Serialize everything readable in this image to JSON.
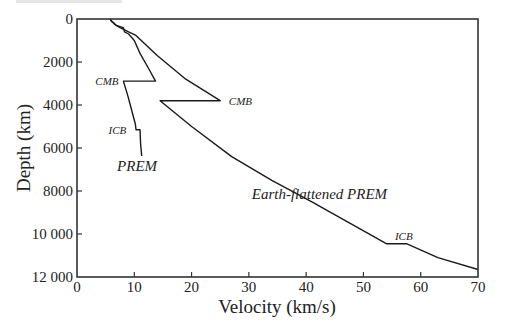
{
  "chart_data": {
    "type": "line",
    "title": "",
    "xlabel": "Velocity (km/s)",
    "ylabel": "Depth (km)",
    "xlim": [
      0,
      70
    ],
    "ylim": [
      0,
      12000
    ],
    "y_inverted": true,
    "grid": false,
    "legend": "none (curves labeled inline)",
    "x_ticks": [
      0,
      10,
      20,
      30,
      40,
      50,
      60,
      70
    ],
    "x_tick_labels": [
      "0",
      "10",
      "20",
      "30",
      "40",
      "50",
      "60",
      "70"
    ],
    "y_ticks": [
      0,
      2000,
      4000,
      6000,
      8000,
      10000,
      12000
    ],
    "y_tick_labels": [
      "0",
      "2000",
      "4000",
      "6000",
      "8000",
      "10 000",
      "12 000"
    ],
    "series": [
      {
        "name": "PREM",
        "x": [
          5.8,
          6.0,
          6.5,
          6.8,
          8.1,
          8.3,
          9.0,
          10.0,
          11.0,
          12.5,
          13.7,
          8.1,
          8.9,
          9.6,
          10.2,
          10.3,
          11.0,
          11.1,
          11.3
        ],
        "y": [
          0,
          100,
          200,
          300,
          400,
          600,
          700,
          1000,
          1600,
          2300,
          2890,
          2890,
          3600,
          4300,
          4900,
          5150,
          5150,
          5800,
          6371
        ]
      },
      {
        "name": "Earth-flattened PREM",
        "x": [
          5.8,
          6.0,
          6.6,
          7.5,
          9.0,
          10.2,
          14.0,
          19.0,
          25.0,
          14.5,
          20.0,
          27.0,
          34.0,
          41.0,
          48.0,
          54.0,
          57.5,
          63.0,
          70.0
        ],
        "y": [
          0,
          100,
          250,
          400,
          600,
          750,
          1700,
          2800,
          3800,
          3800,
          5000,
          6400,
          7500,
          8500,
          9550,
          10450,
          10450,
          11100,
          11650
        ]
      }
    ],
    "annotations": [
      {
        "text": "CMB",
        "x": 3.2,
        "y": 2890,
        "series": "PREM"
      },
      {
        "text": "ICB",
        "x": 5.5,
        "y": 5150,
        "series": "PREM"
      },
      {
        "text": "PREM",
        "x": 7.0,
        "y": 6900,
        "series": "PREM"
      },
      {
        "text": "CMB",
        "x": 26.5,
        "y": 3800,
        "series": "Earth-flattened PREM"
      },
      {
        "text": "Earth-flattened PREM",
        "x": 30.5,
        "y": 8200,
        "series": "Earth-flattened PREM"
      },
      {
        "text": "ICB",
        "x": 55.5,
        "y": 10100,
        "series": "Earth-flattened PREM"
      }
    ]
  },
  "labels": {
    "xlabel": "Velocity (km/s)",
    "ylabel": "Depth (km)"
  }
}
